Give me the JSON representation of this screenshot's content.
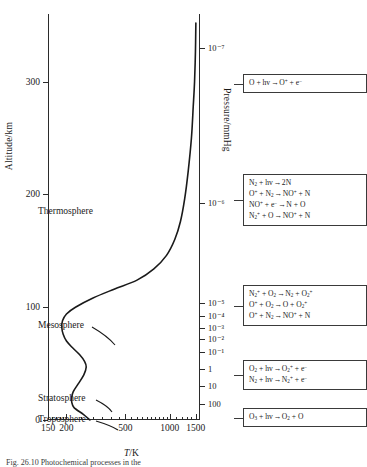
{
  "figure": {
    "caption": "Fig. 26.10   Photochemical processes in the",
    "x_axis": {
      "title": "T/K",
      "scale": "log",
      "ticks": [
        150,
        200,
        500,
        1000,
        1500
      ],
      "labels": [
        "150",
        "200",
        "500",
        "1000",
        "1500"
      ],
      "range": [
        150,
        1600
      ]
    },
    "y_axis": {
      "title": "Altitude/km",
      "scale": "linear",
      "ticks": [
        0,
        100,
        200,
        300
      ],
      "labels": [
        "0",
        "100",
        "200",
        "300"
      ],
      "range": [
        0,
        360
      ]
    },
    "pressure_axis": {
      "title": "Pressure/mmHg",
      "labels": [
        "10⁻⁷",
        "10⁻⁶",
        "10⁻⁵",
        "10⁻⁴",
        "10⁻³",
        "10⁻²",
        "10⁻¹",
        "1",
        "10",
        "100"
      ],
      "altitudes_km": [
        330,
        192,
        104,
        92,
        82,
        72,
        60,
        45,
        30,
        14
      ]
    },
    "regions": [
      {
        "label": "Thermosphere",
        "x": 38,
        "y": 206
      },
      {
        "label": "Mesosphere",
        "x": 38,
        "y": 320
      },
      {
        "label": "Stratosphere",
        "x": 38,
        "y": 393
      },
      {
        "label": "Troposphere",
        "x": 38,
        "y": 414
      }
    ]
  },
  "chart_data": {
    "type": "line",
    "title": "",
    "xlabel": "T/K",
    "ylabel": "Altitude/km",
    "xscale": "log",
    "xlim": [
      150,
      1600
    ],
    "ylim": [
      0,
      360
    ],
    "grid": false,
    "legend": "none",
    "series": [
      {
        "name": "Temperature profile",
        "x": [
          288,
          260,
          225,
          217,
          217,
          222,
          240,
          262,
          272,
          265,
          245,
          220,
          200,
          190,
          186,
          188,
          200,
          230,
          300,
          420,
          600,
          780,
          950,
          1080,
          1180,
          1260,
          1330,
          1400,
          1440,
          1470,
          1490,
          1500
        ],
        "y": [
          0,
          5,
          11,
          16,
          20,
          25,
          32,
          40,
          47,
          52,
          58,
          64,
          70,
          76,
          82,
          88,
          94,
          100,
          108,
          116,
          124,
          134,
          146,
          160,
          176,
          196,
          220,
          250,
          278,
          300,
          326,
          352
        ]
      }
    ]
  },
  "reaction_boxes": [
    {
      "id": "ionosphere-box",
      "reactions": [
        {
          "left": "O + hv",
          "right": "O<sup>+</sup> + e<sup>−</sup>"
        }
      ]
    },
    {
      "id": "thermosphere-box",
      "reactions": [
        {
          "left": "N<sub>2</sub> + hv",
          "right": "2N"
        },
        {
          "left": "O<sup>+</sup> + N<sub>2</sub>",
          "right": "NO<sup>+</sup> + N"
        },
        {
          "left": "NO<sup>+</sup> + e<sup>−</sup>",
          "right": "N + O"
        },
        {
          "left": "N<sub>2</sub><sup>+</sup> + O",
          "right": "NO<sup>+</sup> + N"
        }
      ]
    },
    {
      "id": "mesosphere-box",
      "reactions": [
        {
          "left": "N<sub>2</sub><sup>+</sup> + O<sub>2</sub>",
          "right": "N<sub>2</sub> + O<sub>2</sub><sup>+</sup>"
        },
        {
          "left": "O<sup>+</sup> + O<sub>2</sub>",
          "right": "O + O<sub>2</sub><sup>+</sup>"
        },
        {
          "left": "O<sup>+</sup> + N<sub>2</sub>",
          "right": "NO<sup>+</sup> + N"
        }
      ]
    },
    {
      "id": "stratosphere-box",
      "reactions": [
        {
          "left": "O<sub>2</sub> + hv",
          "right": "O<sub>2</sub><sup>+</sup> + e<sup>−</sup>"
        },
        {
          "left": "N<sub>2</sub> + hv",
          "right": "N<sub>2</sub><sup>+</sup> + e<sup>−</sup>"
        }
      ]
    },
    {
      "id": "ozone-box",
      "reactions": [
        {
          "left": "O<sub>3</sub> + hv",
          "right": "O<sub>2</sub> + O"
        }
      ]
    }
  ]
}
